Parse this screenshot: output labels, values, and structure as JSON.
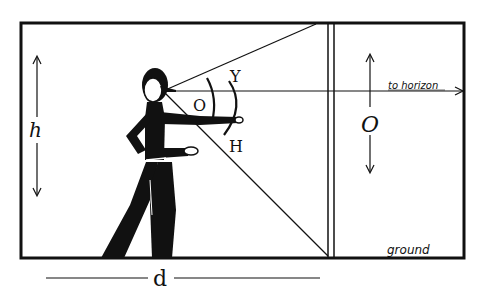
{
  "diagram": {
    "type": "angular-size-measurement",
    "labels": {
      "height": "h",
      "distance": "d",
      "object_size": "O",
      "angle_object": "O",
      "angle_upper": "Y",
      "angle_lower": "H",
      "horizon": "to horizon",
      "ground": "ground"
    },
    "colors": {
      "ink": "#111111",
      "background": "#ffffff"
    }
  }
}
